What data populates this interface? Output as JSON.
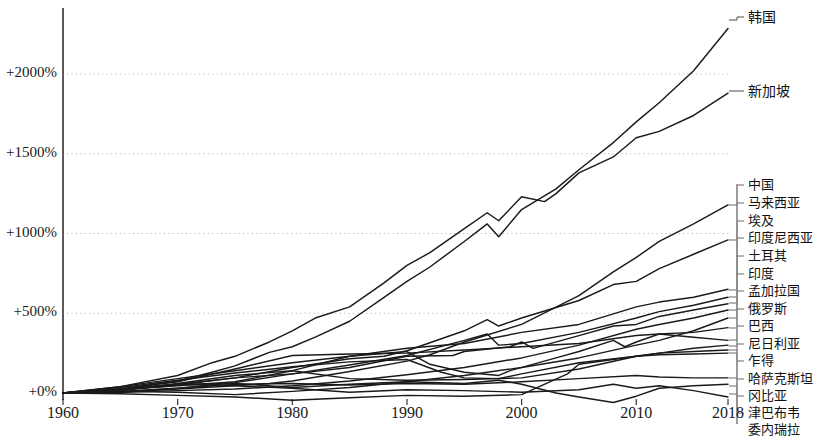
{
  "chart_data": {
    "type": "line",
    "title": "",
    "subtitle": "",
    "xlabel": "",
    "ylabel": "",
    "grid": true,
    "legend_position": "right-labels",
    "xlim": [
      1960,
      2018
    ],
    "ylim": [
      -150,
      2350
    ],
    "x_ticks": [
      1960,
      1970,
      1980,
      1990,
      2000,
      2010,
      2018
    ],
    "x_tick_labels": [
      "1960",
      "1970",
      "1980",
      "1990",
      "2000",
      "2010",
      "2018"
    ],
    "y_ticks": [
      0,
      500,
      1000,
      1500,
      2000
    ],
    "y_tick_labels": [
      "+0%",
      "+500%",
      "+1000%",
      "+1500%",
      "+2000%"
    ],
    "line_color": "#1a1a1a",
    "grid_color": "#bbbbbb",
    "axis_color": "#000000",
    "series": [
      {
        "name": "韩国",
        "label": "韩国",
        "end_value": 2285,
        "x": [
          1960,
          1965,
          1970,
          1973,
          1975,
          1978,
          1980,
          1982,
          1985,
          1988,
          1990,
          1992,
          1995,
          1997,
          1998,
          2000,
          2003,
          2005,
          2008,
          2010,
          2012,
          2015,
          2018
        ],
        "values": [
          0,
          25,
          75,
          130,
          170,
          255,
          290,
          350,
          450,
          600,
          700,
          790,
          950,
          1060,
          980,
          1150,
          1280,
          1400,
          1570,
          1700,
          1820,
          2020,
          2285
        ]
      },
      {
        "name": "新加坡",
        "label": "新加坡",
        "end_value": 1880,
        "x": [
          1960,
          1965,
          1970,
          1973,
          1975,
          1978,
          1980,
          1982,
          1985,
          1988,
          1990,
          1992,
          1995,
          1997,
          1998,
          2000,
          2002,
          2003,
          2005,
          2008,
          2010,
          2012,
          2015,
          2018
        ],
        "values": [
          0,
          40,
          110,
          190,
          230,
          320,
          390,
          470,
          540,
          690,
          800,
          880,
          1030,
          1130,
          1080,
          1230,
          1200,
          1250,
          1380,
          1480,
          1600,
          1640,
          1740,
          1880
        ]
      },
      {
        "name": "中国",
        "label": "中国",
        "end_value": 1180,
        "x": [
          1960,
          1965,
          1970,
          1975,
          1978,
          1980,
          1985,
          1990,
          1992,
          1995,
          2000,
          2005,
          2008,
          2010,
          2012,
          2015,
          2018
        ],
        "values": [
          0,
          5,
          25,
          45,
          60,
          75,
          135,
          200,
          240,
          320,
          430,
          610,
          760,
          850,
          950,
          1060,
          1180
        ]
      },
      {
        "name": "马来西亚",
        "label": "马来西亚",
        "end_value": 960,
        "x": [
          1960,
          1965,
          1970,
          1975,
          1980,
          1985,
          1988,
          1990,
          1995,
          1997,
          1998,
          2000,
          2005,
          2008,
          2010,
          2012,
          2015,
          2018
        ],
        "values": [
          0,
          20,
          55,
          95,
          160,
          215,
          230,
          265,
          390,
          460,
          420,
          470,
          580,
          680,
          700,
          780,
          870,
          960
        ]
      },
      {
        "name": "埃及",
        "label": "埃及",
        "end_value": 650,
        "x": [
          1960,
          1965,
          1970,
          1975,
          1980,
          1985,
          1990,
          1995,
          2000,
          2005,
          2010,
          2012,
          2015,
          2018
        ],
        "values": [
          0,
          20,
          45,
          70,
          140,
          230,
          280,
          310,
          380,
          430,
          540,
          570,
          600,
          650
        ]
      },
      {
        "name": "印度尼西亚",
        "label": "印度尼西亚",
        "end_value": 600,
        "x": [
          1960,
          1965,
          1970,
          1975,
          1980,
          1985,
          1990,
          1995,
          1997,
          1998,
          2000,
          2005,
          2010,
          2012,
          2015,
          2018
        ],
        "values": [
          0,
          8,
          30,
          65,
          120,
          175,
          235,
          330,
          370,
          300,
          310,
          380,
          470,
          510,
          550,
          600
        ]
      },
      {
        "name": "土耳其",
        "label": "土耳其",
        "end_value": 560,
        "x": [
          1960,
          1965,
          1970,
          1975,
          1980,
          1985,
          1990,
          1994,
          1995,
          1999,
          2000,
          2001,
          2005,
          2008,
          2010,
          2012,
          2015,
          2018
        ],
        "values": [
          0,
          18,
          50,
          95,
          120,
          160,
          230,
          235,
          260,
          290,
          320,
          280,
          360,
          420,
          430,
          480,
          520,
          560
        ]
      },
      {
        "name": "印度",
        "label": "印度",
        "end_value": 520,
        "x": [
          1960,
          1965,
          1970,
          1975,
          1980,
          1985,
          1990,
          1995,
          2000,
          2005,
          2010,
          2012,
          2015,
          2018
        ],
        "values": [
          0,
          5,
          15,
          25,
          45,
          75,
          115,
          160,
          220,
          300,
          400,
          430,
          470,
          520
        ]
      },
      {
        "name": "孟加拉国",
        "label": "孟加拉国",
        "end_value": 470,
        "x": [
          1960,
          1965,
          1970,
          1975,
          1980,
          1985,
          1990,
          1995,
          2000,
          2005,
          2010,
          2012,
          2015,
          2018
        ],
        "values": [
          0,
          10,
          5,
          -10,
          10,
          35,
          70,
          110,
          160,
          220,
          300,
          330,
          390,
          470
        ]
      },
      {
        "name": "俄罗斯",
        "label": "俄罗斯",
        "end_value": 410,
        "x": [
          1960,
          1965,
          1970,
          1975,
          1980,
          1985,
          1990,
          1992,
          1995,
          1998,
          1999,
          2003,
          2005,
          2008,
          2009,
          2010,
          2012,
          2015,
          2018
        ],
        "values": [
          0,
          40,
          90,
          140,
          190,
          230,
          260,
          180,
          130,
          110,
          140,
          220,
          260,
          330,
          290,
          320,
          370,
          380,
          410
        ]
      },
      {
        "name": "巴西",
        "label": "巴西",
        "end_value": 330,
        "x": [
          1960,
          1965,
          1970,
          1975,
          1980,
          1985,
          1990,
          1995,
          2000,
          2005,
          2010,
          2012,
          2015,
          2018
        ],
        "values": [
          0,
          25,
          70,
          150,
          235,
          245,
          250,
          270,
          290,
          310,
          360,
          370,
          350,
          330
        ]
      },
      {
        "name": "尼日利亚",
        "label": "尼日利亚",
        "end_value": 300,
        "x": [
          1960,
          1965,
          1970,
          1975,
          1980,
          1985,
          1990,
          1995,
          2000,
          2005,
          2010,
          2012,
          2015,
          2018
        ],
        "values": [
          0,
          15,
          60,
          110,
          140,
          90,
          80,
          85,
          95,
          150,
          230,
          250,
          280,
          300
        ]
      },
      {
        "name": "乍得",
        "label": "乍得",
        "end_value": 270,
        "x": [
          1960,
          1965,
          1970,
          1975,
          1980,
          1985,
          1990,
          1995,
          2000,
          2004,
          2005,
          2010,
          2012,
          2015,
          2018
        ],
        "values": [
          0,
          -5,
          -15,
          -25,
          -45,
          -30,
          -15,
          -20,
          -10,
          120,
          180,
          230,
          250,
          260,
          270
        ]
      },
      {
        "name": "哈萨克斯坦",
        "label": "哈萨克斯坦",
        "end_value": 250,
        "x": [
          1960,
          1965,
          1970,
          1975,
          1980,
          1985,
          1990,
          1993,
          1995,
          1998,
          2000,
          2005,
          2010,
          2012,
          2015,
          2018
        ],
        "values": [
          0,
          35,
          80,
          125,
          165,
          195,
          210,
          130,
          95,
          90,
          120,
          190,
          230,
          240,
          245,
          250
        ]
      },
      {
        "name": "冈比亚",
        "label": "冈比亚",
        "end_value": 95,
        "x": [
          1960,
          1965,
          1970,
          1975,
          1980,
          1985,
          1990,
          1995,
          2000,
          2005,
          2010,
          2012,
          2015,
          2018
        ],
        "values": [
          0,
          10,
          30,
          55,
          60,
          50,
          60,
          55,
          70,
          90,
          110,
          100,
          95,
          95
        ]
      },
      {
        "name": "津巴布韦",
        "label": "津巴布韦",
        "end_value": 55,
        "x": [
          1960,
          1965,
          1970,
          1975,
          1980,
          1985,
          1990,
          1995,
          1998,
          2000,
          2003,
          2005,
          2008,
          2010,
          2012,
          2015,
          2018
        ],
        "values": [
          0,
          20,
          55,
          60,
          35,
          55,
          70,
          60,
          80,
          55,
          0,
          -25,
          -60,
          -20,
          30,
          45,
          55
        ]
      },
      {
        "name": "委内瑞拉",
        "label": "委内瑞拉",
        "end_value": -25,
        "x": [
          1960,
          1965,
          1970,
          1975,
          1980,
          1985,
          1990,
          1995,
          2000,
          2005,
          2008,
          2010,
          2012,
          2015,
          2018
        ],
        "values": [
          0,
          25,
          55,
          45,
          30,
          5,
          20,
          15,
          5,
          20,
          55,
          30,
          45,
          15,
          -25
        ]
      }
    ],
    "label_entries": [
      {
        "label": "韩国",
        "label_y": 22,
        "anchor_y": 20,
        "leader": "step"
      },
      {
        "label": "新加坡",
        "label_y": 96,
        "anchor_y": 98,
        "leader": "flat"
      },
      {
        "label": "中国",
        "label_y": 190,
        "anchor_y": 205,
        "leader": "bracket"
      },
      {
        "label": "马来西亚",
        "label_y": 208,
        "anchor_y": 240,
        "leader": "bracket"
      },
      {
        "label": "埃及",
        "label_y": 226,
        "anchor_y": 290,
        "leader": "bracket"
      },
      {
        "label": "印度尼西亚",
        "label_y": 243,
        "anchor_y": 297,
        "leader": "bracket"
      },
      {
        "label": "土耳其",
        "label_y": 261,
        "anchor_y": 303,
        "leader": "bracket"
      },
      {
        "label": "印度",
        "label_y": 279,
        "anchor_y": 310,
        "leader": "bracket"
      },
      {
        "label": "孟加拉国",
        "label_y": 296,
        "anchor_y": 318,
        "leader": "bracket"
      },
      {
        "label": "俄罗斯",
        "label_y": 314,
        "anchor_y": 328,
        "leader": "bracket"
      },
      {
        "label": "巴西",
        "label_y": 331,
        "anchor_y": 340,
        "leader": "bracket"
      },
      {
        "label": "尼日利亚",
        "label_y": 349,
        "anchor_y": 346,
        "leader": "bracket"
      },
      {
        "label": "乍得",
        "label_y": 366,
        "anchor_y": 350,
        "leader": "bracket"
      },
      {
        "label": "哈萨克斯坦",
        "label_y": 384,
        "anchor_y": 353,
        "leader": "bracket"
      },
      {
        "label": "冈比亚",
        "label_y": 401,
        "anchor_y": 378,
        "leader": "bracket"
      },
      {
        "label": "津巴布韦",
        "label_y": 418,
        "anchor_y": 386,
        "leader": "bracket"
      },
      {
        "label": "委内瑞拉",
        "label_y": 435,
        "anchor_y": 394,
        "leader": "bracket"
      }
    ]
  }
}
